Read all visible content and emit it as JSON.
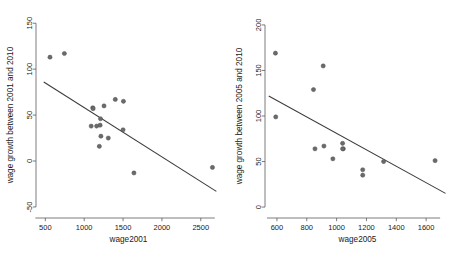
{
  "figure": {
    "title": "",
    "panel_count": 2
  },
  "chart_data": [
    {
      "type": "scatter",
      "panel": "left",
      "title": "",
      "xlabel": "wage2001",
      "ylabel": "wage growth between 2001 and 2010",
      "xlim": [
        380,
        2760
      ],
      "ylim": [
        -62,
        160
      ],
      "xticks": [
        500,
        1000,
        1500,
        2000,
        2500
      ],
      "yticks": [
        -50,
        0,
        50,
        100,
        150
      ],
      "xticklabels": [
        "500",
        "1000",
        "1500",
        "2000",
        "2500"
      ],
      "yticklabels": [
        "-50",
        "0",
        "50",
        "100",
        "150"
      ],
      "grid": false,
      "legend": null,
      "x": [
        560,
        745,
        1110,
        1115,
        1210,
        1255,
        1205,
        1090,
        1160,
        1215,
        1195,
        1310,
        1400,
        1500,
        1505,
        1640,
        2650
      ],
      "y": [
        113,
        117,
        58,
        57,
        46,
        60,
        39,
        38,
        38,
        27,
        16,
        25,
        67,
        34,
        65,
        -13,
        -7
      ],
      "fit_line": {
        "x": [
          480,
          2700
        ],
        "y": [
          86,
          -33
        ],
        "slope": -0.0536,
        "intercept": 111.7
      }
    },
    {
      "type": "scatter",
      "panel": "right",
      "title": "",
      "xlabel": "wage2005",
      "ylabel": "wage growth between 2005 and 2010",
      "xlim": [
        520,
        1760
      ],
      "ylim": [
        -12,
        212
      ],
      "xticks": [
        600,
        800,
        1000,
        1200,
        1400,
        1600
      ],
      "yticks": [
        0,
        50,
        100,
        150,
        200
      ],
      "xticklabels": [
        "600",
        "800",
        "1000",
        "1200",
        "1400",
        "1600"
      ],
      "yticklabels": [
        "0",
        "50",
        "100",
        "150",
        "200"
      ],
      "grid": false,
      "legend": null,
      "x": [
        590,
        592,
        845,
        855,
        910,
        915,
        975,
        1040,
        1045,
        1040,
        1175,
        1175,
        1315,
        1660
      ],
      "y": [
        169,
        99,
        129,
        64,
        155,
        67,
        53,
        70,
        64,
        64,
        41,
        35,
        50,
        51
      ],
      "fit_line": {
        "x": [
          545,
          1730
        ],
        "y": [
          122,
          15
        ],
        "slope": -0.0903,
        "intercept": 171.2
      }
    }
  ],
  "colors": {
    "point_fill": "#6b6b6b",
    "point_stroke": "#4a4a4a",
    "fit_line": "#3a3a3a",
    "axis": "#5a5a5a",
    "text": "#1a1a1a",
    "background": "#ffffff"
  }
}
